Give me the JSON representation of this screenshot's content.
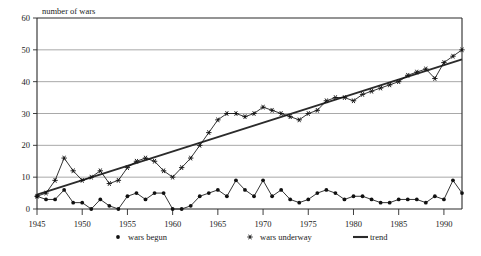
{
  "chart_data": {
    "type": "line",
    "title": "",
    "ylabel": "number of wars",
    "xlabel": "",
    "ylim": [
      0,
      60
    ],
    "xlim": [
      1945,
      1992
    ],
    "yticks": [
      0,
      10,
      20,
      30,
      40,
      50,
      60
    ],
    "xticks": [
      1945,
      1950,
      1955,
      1960,
      1965,
      1970,
      1975,
      1980,
      1985,
      1990
    ],
    "grid": true,
    "legend_position": "below",
    "x": [
      1945,
      1946,
      1947,
      1948,
      1949,
      1950,
      1951,
      1952,
      1953,
      1954,
      1955,
      1956,
      1957,
      1958,
      1959,
      1960,
      1961,
      1962,
      1963,
      1964,
      1965,
      1966,
      1967,
      1968,
      1969,
      1970,
      1971,
      1972,
      1973,
      1974,
      1975,
      1976,
      1977,
      1978,
      1979,
      1980,
      1981,
      1982,
      1983,
      1984,
      1985,
      1986,
      1987,
      1988,
      1989,
      1990,
      1991,
      1992
    ],
    "series": [
      {
        "name": "wars begun",
        "marker": "dot",
        "values": [
          4,
          3,
          3,
          6,
          2,
          2,
          0,
          3,
          1,
          0,
          4,
          5,
          3,
          5,
          5,
          0,
          0,
          1,
          4,
          5,
          6,
          4,
          9,
          6,
          4,
          9,
          4,
          6,
          3,
          2,
          3,
          5,
          6,
          5,
          3,
          4,
          4,
          3,
          2,
          2,
          3,
          3,
          3,
          2,
          4,
          3,
          9,
          5
        ]
      },
      {
        "name": "wars underway",
        "marker": "asterisk",
        "values": [
          4,
          5,
          9,
          16,
          12,
          9,
          10,
          12,
          8,
          9,
          13,
          15,
          16,
          15,
          12,
          10,
          13,
          16,
          20,
          24,
          28,
          30,
          30,
          29,
          30,
          32,
          31,
          30,
          29,
          28,
          30,
          31,
          34,
          35,
          35,
          34,
          36,
          37,
          38,
          39,
          40,
          42,
          43,
          44,
          41,
          46,
          48,
          50
        ]
      }
    ],
    "trend": {
      "name": "trend",
      "x": [
        1945,
        1992
      ],
      "values": [
        4.5,
        47.0
      ]
    }
  },
  "legend": {
    "items": [
      {
        "label": "wars begun",
        "marker": "dot"
      },
      {
        "label": "wars underway",
        "marker": "asterisk"
      },
      {
        "label": "trend",
        "marker": "line"
      }
    ]
  }
}
